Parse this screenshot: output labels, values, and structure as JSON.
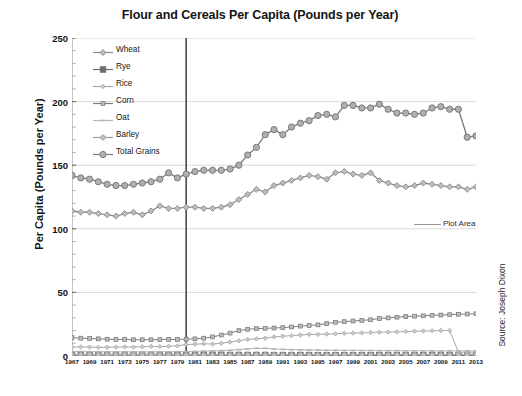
{
  "chart_data": {
    "type": "line",
    "title": "Flour and Cereals Per Capita (Pounds per Year)",
    "xlabel": "",
    "ylabel": "Per Capita (Pounds per Year)",
    "ylim": [
      0,
      250
    ],
    "yticks": [
      0,
      50,
      100,
      150,
      200,
      250
    ],
    "grid": true,
    "legend_position": "upper-left-inside",
    "source": "Source: Joseph Dixon",
    "plot_area_annotation": "Plot Area",
    "reference_line_year": 1980,
    "x": [
      1967,
      1968,
      1969,
      1970,
      1971,
      1972,
      1973,
      1974,
      1975,
      1976,
      1977,
      1978,
      1979,
      1980,
      1981,
      1982,
      1983,
      1984,
      1985,
      1986,
      1987,
      1988,
      1989,
      1990,
      1991,
      1992,
      1993,
      1994,
      1995,
      1996,
      1997,
      1998,
      1999,
      2000,
      2001,
      2002,
      2003,
      2004,
      2005,
      2006,
      2007,
      2008,
      2009,
      2010,
      2011,
      2012,
      2013
    ],
    "xtick_labels": [
      "1967",
      "1969",
      "1971",
      "1973",
      "1975",
      "1977",
      "1979",
      "1981",
      "1983",
      "1985",
      "1987",
      "1989",
      "1991",
      "1993",
      "1995",
      "1997",
      "1999",
      "2001",
      "2003",
      "2005",
      "2007",
      "2009",
      "2011",
      "2013"
    ],
    "series": [
      {
        "name": "Wheat",
        "marker": "diamond",
        "color": "#8a8a8a",
        "values": [
          114,
          113,
          113,
          112,
          111,
          110,
          112,
          113,
          111,
          114,
          118,
          116,
          116,
          117,
          117,
          116,
          116,
          117,
          119,
          123,
          127,
          131,
          129,
          134,
          136,
          138,
          140,
          142,
          141,
          139,
          144,
          145,
          143,
          142,
          144,
          138,
          136,
          134,
          133,
          134,
          136,
          135,
          134,
          133,
          133,
          131,
          133
        ]
      },
      {
        "name": "Rye",
        "marker": "square",
        "color": "#6e6e6e",
        "values": [
          1.0,
          1.0,
          1.0,
          1.0,
          1.0,
          1.0,
          1.0,
          1.0,
          1.0,
          1.0,
          1.0,
          1.0,
          1.0,
          0.9,
          0.9,
          0.9,
          0.9,
          0.9,
          0.8,
          0.8,
          0.8,
          0.8,
          0.8,
          0.7,
          0.7,
          0.7,
          0.7,
          0.7,
          0.6,
          0.6,
          0.6,
          0.6,
          0.6,
          0.6,
          0.5,
          0.5,
          0.5,
          0.5,
          0.5,
          0.5,
          0.5,
          0.5,
          0.5,
          0.5,
          0.4,
          0.4,
          0.4
        ]
      },
      {
        "name": "Rice",
        "marker": "diamond-small",
        "color": "#a8a8a8",
        "values": [
          7.0,
          7.1,
          7.0,
          6.8,
          6.9,
          7.0,
          7.2,
          7.0,
          7.3,
          7.5,
          7.4,
          7.6,
          8.0,
          9.0,
          9.3,
          9.6,
          9.4,
          10.0,
          11.0,
          12.0,
          13.0,
          13.5,
          14.0,
          15.0,
          15.5,
          16.0,
          16.5,
          17.0,
          17.0,
          17.2,
          17.5,
          17.8,
          18.0,
          18.2,
          18.5,
          18.7,
          18.8,
          19.0,
          19.2,
          19.5,
          19.6,
          19.8,
          20.0,
          20.0,
          3.0,
          3.0,
          3.0
        ]
      },
      {
        "name": "Corn",
        "marker": "square-small",
        "color": "#7d7d7d",
        "values": [
          14.5,
          14.0,
          13.8,
          13.5,
          13.2,
          13.0,
          13.0,
          12.8,
          12.8,
          12.8,
          12.9,
          13.0,
          13.0,
          13.2,
          13.5,
          14.0,
          15.0,
          16.5,
          18.0,
          20.0,
          21.0,
          21.5,
          21.8,
          22.0,
          22.3,
          22.8,
          23.5,
          24.0,
          24.5,
          25.5,
          26.5,
          27.0,
          27.5,
          28.0,
          28.5,
          29.5,
          30.0,
          30.5,
          31.0,
          31.3,
          31.6,
          32.0,
          32.2,
          32.5,
          32.8,
          33.0,
          33.2
        ]
      },
      {
        "name": "Oat",
        "marker": "dash",
        "color": "#b5b5b5",
        "values": [
          3.5,
          3.5,
          3.4,
          3.4,
          3.3,
          3.3,
          3.2,
          3.2,
          3.2,
          3.2,
          3.3,
          3.3,
          3.4,
          3.5,
          3.6,
          3.8,
          4.0,
          4.2,
          4.5,
          5.0,
          5.5,
          6.0,
          6.0,
          5.5,
          5.2,
          5.0,
          4.8,
          4.7,
          4.6,
          4.5,
          4.5,
          4.4,
          4.4,
          4.3,
          4.3,
          4.2,
          4.2,
          4.2,
          4.1,
          4.1,
          4.1,
          4.0,
          4.0,
          4.0,
          4.0,
          4.0,
          4.0
        ]
      },
      {
        "name": "Barley",
        "marker": "diamond",
        "color": "#9c9c9c",
        "values": [
          1.2,
          1.2,
          1.2,
          1.1,
          1.1,
          1.1,
          1.1,
          1.1,
          1.0,
          1.0,
          1.0,
          1.0,
          1.0,
          1.0,
          1.0,
          1.0,
          1.0,
          1.0,
          1.0,
          1.0,
          1.0,
          1.0,
          1.0,
          1.0,
          1.0,
          1.0,
          1.0,
          1.0,
          1.0,
          1.0,
          1.0,
          1.0,
          1.0,
          1.0,
          1.0,
          1.0,
          1.0,
          1.0,
          1.0,
          1.0,
          1.0,
          1.0,
          1.0,
          1.0,
          1.0,
          1.0,
          1.0
        ]
      },
      {
        "name": "Total Grains",
        "marker": "circle",
        "color": "#7a7a7a",
        "values": [
          142,
          140,
          139,
          137,
          135,
          134,
          134,
          135,
          136,
          137,
          139,
          144,
          140,
          143,
          145,
          146,
          146,
          146,
          147,
          150,
          158,
          164,
          174,
          178,
          174,
          180,
          183,
          185,
          189,
          190,
          188,
          197,
          197,
          195,
          195,
          198,
          194,
          191,
          191,
          190,
          191,
          195,
          196,
          194,
          194,
          172,
          173
        ]
      }
    ]
  }
}
